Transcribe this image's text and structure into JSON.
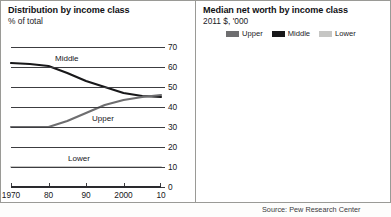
{
  "left_panel": {
    "title": "Distribution by income class",
    "subtitle": "% of total",
    "series_labels": {
      "middle": "Middle",
      "upper": "Upper",
      "lower": "Lower"
    }
  },
  "right_panel": {
    "title": "Median net worth by income class",
    "subtitle": "2011 $, '000",
    "legend": [
      {
        "label": "Upper",
        "color": "#6e6e70"
      },
      {
        "label": "Middle",
        "color": "#18181a"
      },
      {
        "label": "Lower",
        "color": "#c6c6c4"
      }
    ]
  },
  "source": "Source: Pew Research Center",
  "colors": {
    "upper": "#6e6e70",
    "middle": "#18181a",
    "lower": "#c6c6c4",
    "grid": "#3c3c40",
    "panel_border": "#9a9a96"
  },
  "chart_data": [
    {
      "type": "line",
      "title": "Distribution by income class",
      "subtitle": "% of total",
      "xlabel": "",
      "ylabel": "% of total",
      "ylim": [
        0,
        70
      ],
      "yticks": [
        0,
        10,
        20,
        30,
        40,
        50,
        60,
        70
      ],
      "xlim": [
        1970,
        2010
      ],
      "xticks": [
        1970,
        1980,
        1990,
        2000,
        2010
      ],
      "xticklabels": [
        "1970",
        "80",
        "90",
        "2000",
        "10"
      ],
      "grid": true,
      "legend_position": "inline-labels",
      "x": [
        1970,
        1975,
        1980,
        1985,
        1990,
        1995,
        2000,
        2005,
        2010
      ],
      "series": [
        {
          "name": "Middle",
          "color": "#18181a",
          "values": [
            62,
            61.5,
            60.5,
            57,
            53,
            50,
            47,
            45.5,
            45
          ]
        },
        {
          "name": "Upper",
          "color": "#6e6e70",
          "values": [
            30,
            30,
            30,
            33,
            37,
            41,
            43.5,
            45,
            46
          ]
        },
        {
          "name": "Lower",
          "color": "#c6c6c4",
          "values": [
            10,
            10,
            10,
            10,
            10,
            10,
            10,
            10,
            10
          ]
        }
      ]
    },
    {
      "type": "bar",
      "title": "Median net worth by income class",
      "subtitle": "2011 $, '000",
      "xlabel": "",
      "ylabel": "2011 $, '000",
      "ylim": [
        0,
        700
      ],
      "yticks": [
        0,
        100,
        200,
        300,
        400,
        500,
        600,
        700
      ],
      "categories": [
        "1983",
        "92",
        "2001",
        "07",
        "10"
      ],
      "grid": true,
      "legend_position": "top",
      "series": [
        {
          "name": "Middle",
          "color": "#18181a",
          "values": [
            80,
            80,
            120,
            145,
            90
          ]
        },
        {
          "name": "Upper",
          "color": "#6e6e70",
          "values": [
            305,
            325,
            560,
            690,
            570
          ]
        },
        {
          "name": "Lower",
          "color": "#c6c6c4",
          "values": [
            5,
            4,
            14,
            16,
            6
          ]
        }
      ]
    }
  ]
}
